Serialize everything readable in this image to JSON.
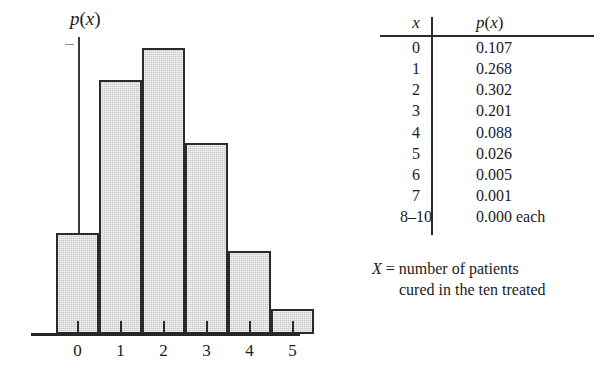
{
  "chart_data": {
    "type": "bar",
    "title": "",
    "subtitle": "",
    "xlabel": "",
    "ylabel": "p(x)",
    "categories": [
      "0",
      "1",
      "2",
      "3",
      "4",
      "5"
    ],
    "values": [
      0.107,
      0.268,
      0.302,
      0.201,
      0.088,
      0.026
    ],
    "xlim": [
      -0.5,
      5.5
    ],
    "ylim": [
      0,
      0.352
    ],
    "grid": false,
    "legend": null,
    "bar_fill_color": "#c9c9c9",
    "bar_edge_color": "#2b2b2b",
    "axis_color": "#262626",
    "tick_labels": [
      "0",
      "1",
      "2",
      "3",
      "4",
      "5"
    ],
    "annotations": []
  },
  "figure": {
    "y_axis_label_var": "p",
    "y_axis_label_paren_open": "(",
    "y_axis_label_arg": "x",
    "y_axis_label_paren_close": ")"
  },
  "table": {
    "headers": {
      "x_var": "x",
      "p_var": "p",
      "p_paren_open": "(",
      "p_arg": "x",
      "p_paren_close": ")"
    },
    "rows": [
      {
        "x": "0",
        "p": "0.107"
      },
      {
        "x": "1",
        "p": "0.268"
      },
      {
        "x": "2",
        "p": "0.302"
      },
      {
        "x": "3",
        "p": "0.201"
      },
      {
        "x": "4",
        "p": "0.088"
      },
      {
        "x": "5",
        "p": "0.026"
      },
      {
        "x": "6",
        "p": "0.005"
      },
      {
        "x": "7",
        "p": "0.001"
      },
      {
        "x": "8–10",
        "p": "0.000 each"
      }
    ]
  },
  "caption": {
    "variable": "X",
    "equals": "=",
    "line1": "number of patients",
    "line2": "cured in the ten treated"
  }
}
